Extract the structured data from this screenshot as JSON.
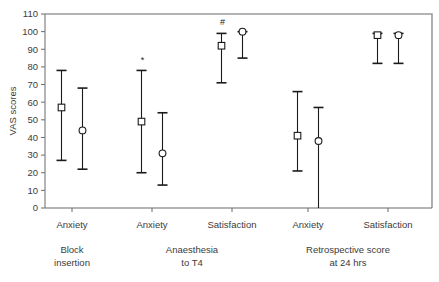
{
  "chart_data": {
    "type": "scatter",
    "title": "",
    "subtitle": "",
    "xlabel": "",
    "ylabel": "VAS scores",
    "ylim": [
      0,
      110
    ],
    "yticks": [
      0,
      10,
      20,
      30,
      40,
      50,
      60,
      70,
      80,
      90,
      100,
      110
    ],
    "grid": false,
    "legend_position": "none",
    "style": "error-bars with mean markers (square = group 1, open circle = group 2)",
    "categories": [
      "Anxiety",
      "Anxiety",
      "Satisfaction",
      "Anxiety",
      "Satisfaction"
    ],
    "group_labels": [
      {
        "label": "Block\ninsertion",
        "line1": "Block",
        "line2": "insertion"
      },
      {
        "label": "Anaesthesia\nto T4",
        "line1": "Anaesthesia",
        "line2": "to T4"
      },
      {
        "label": "Retrospective score\nat 24 hrs",
        "line1": "Retrospective score",
        "line2": "at 24 hrs"
      }
    ],
    "series": [
      {
        "name": "square",
        "marker": "open-square",
        "values": [
          57,
          49,
          92,
          41,
          98
        ],
        "lower": [
          27,
          20,
          71,
          21,
          82
        ],
        "upper": [
          78,
          78,
          99,
          66,
          99
        ]
      },
      {
        "name": "circle",
        "marker": "open-circle",
        "values": [
          44,
          31,
          100,
          38,
          98
        ],
        "lower": [
          22,
          13,
          85,
          0,
          82
        ],
        "upper": [
          68,
          54,
          100,
          57,
          99
        ]
      }
    ],
    "annotations": [
      {
        "text": "*",
        "series": "square",
        "category_index": 1,
        "y": 82
      },
      {
        "text": "#",
        "series": "square",
        "category_index": 2,
        "y": 104
      }
    ]
  }
}
